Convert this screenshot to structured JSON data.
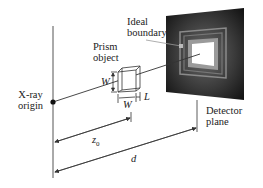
{
  "diagram": {
    "type": "x-ray projection geometry schematic",
    "labels": {
      "ideal_boundary_line1": "Ideal",
      "ideal_boundary_line2": "boundary",
      "prism_line1": "Prism",
      "prism_line2": "object",
      "xray_line1": "X-ray",
      "xray_line2": "origin",
      "detector_line1": "Detector",
      "detector_line2": "plane",
      "dim_w_vertical": "W",
      "dim_w_horizontal": "W",
      "dim_l": "L",
      "dim_z0_base": "z",
      "dim_z0_sub": "0",
      "dim_d": "d"
    },
    "colors": {
      "line": "#333333",
      "detector_dark": "#1a1a1a",
      "detector_mid": "#555555",
      "boundary_gray": "#8a8a8a",
      "shadow_white": "#ffffff"
    }
  }
}
